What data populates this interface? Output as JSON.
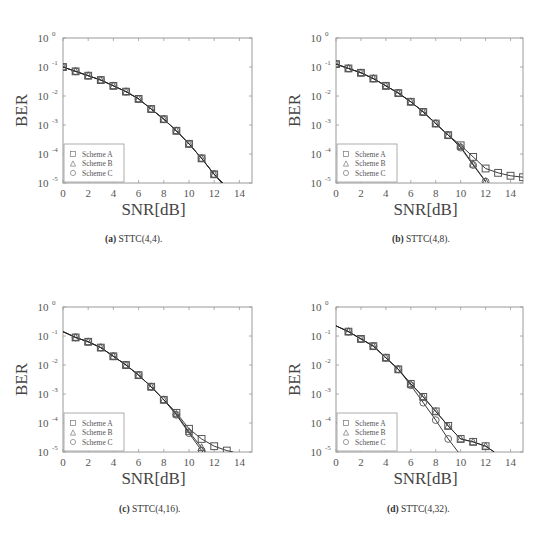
{
  "chart_data": [
    {
      "type": "line",
      "caption_label": "(a)",
      "caption_text": "STTC(4,4).",
      "xlabel": "SNR[dB]",
      "ylabel": "BER",
      "xlim": [
        0,
        15
      ],
      "ylim": [
        1e-05,
        1
      ],
      "yscale": "log",
      "xticks": [
        0,
        2,
        4,
        6,
        8,
        10,
        12,
        14
      ],
      "yticks_exp": [
        0,
        -1,
        -2,
        -3,
        -4,
        -5
      ],
      "legend": [
        "Scheme A",
        "Scheme B",
        "Scheme C"
      ],
      "legend_position": "lower left",
      "grid": false,
      "series": [
        {
          "name": "Scheme A",
          "marker": "square",
          "x": [
            0,
            1,
            2,
            3,
            4,
            5,
            6,
            7,
            8,
            9,
            10,
            11,
            12
          ],
          "log10_y": [
            -1.0,
            -1.15,
            -1.3,
            -1.45,
            -1.65,
            -1.85,
            -2.1,
            -2.45,
            -2.8,
            -3.2,
            -3.65,
            -4.15,
            -4.7
          ],
          "line_end": [
            12.7,
            -5.0
          ]
        },
        {
          "name": "Scheme B",
          "marker": "triangle",
          "x": [
            0,
            1,
            2,
            3,
            4,
            5,
            6,
            7,
            8,
            9,
            10,
            11,
            12
          ],
          "log10_y": [
            -1.0,
            -1.15,
            -1.3,
            -1.45,
            -1.65,
            -1.85,
            -2.1,
            -2.45,
            -2.8,
            -3.2,
            -3.65,
            -4.15,
            -4.7
          ],
          "line_end": [
            12.6,
            -5.0
          ]
        },
        {
          "name": "Scheme C",
          "marker": "circle",
          "x": [
            0,
            1,
            2,
            3,
            4,
            5,
            6,
            7,
            8,
            9,
            10,
            11,
            12
          ],
          "log10_y": [
            -1.0,
            -1.15,
            -1.3,
            -1.45,
            -1.65,
            -1.85,
            -2.1,
            -2.45,
            -2.8,
            -3.2,
            -3.65,
            -4.15,
            -4.7
          ],
          "line_end": [
            12.6,
            -5.0
          ]
        }
      ]
    },
    {
      "type": "line",
      "caption_label": "(b)",
      "caption_text": "STTC(4,8).",
      "xlabel": "SNR[dB]",
      "ylabel": "BER",
      "xlim": [
        0,
        15
      ],
      "ylim": [
        1e-05,
        1
      ],
      "yscale": "log",
      "xticks": [
        0,
        2,
        4,
        6,
        8,
        10,
        12,
        14
      ],
      "yticks_exp": [
        0,
        -1,
        -2,
        -3,
        -4,
        -5
      ],
      "legend": [
        "Scheme A",
        "Scheme B",
        "Scheme C"
      ],
      "legend_position": "lower left",
      "grid": false,
      "series": [
        {
          "name": "Scheme A",
          "marker": "square",
          "x": [
            0,
            1,
            2,
            3,
            4,
            5,
            6,
            7,
            8,
            9,
            10,
            11,
            12,
            13,
            14,
            15
          ],
          "log10_y": [
            -0.9,
            -1.05,
            -1.2,
            -1.4,
            -1.65,
            -1.9,
            -2.2,
            -2.55,
            -2.95,
            -3.35,
            -3.7,
            -4.1,
            -4.5,
            -4.65,
            -4.75,
            -4.8
          ]
        },
        {
          "name": "Scheme B",
          "marker": "triangle",
          "x": [
            0,
            1,
            2,
            3,
            4,
            5,
            6,
            7,
            8,
            9,
            10,
            11,
            12
          ],
          "log10_y": [
            -0.9,
            -1.05,
            -1.2,
            -1.4,
            -1.65,
            -1.9,
            -2.2,
            -2.55,
            -2.95,
            -3.35,
            -3.75,
            -4.35,
            -4.95
          ]
        },
        {
          "name": "Scheme C",
          "marker": "circle",
          "x": [
            0,
            1,
            2,
            3,
            4,
            5,
            6,
            7,
            8,
            9,
            10,
            11,
            12
          ],
          "log10_y": [
            -0.9,
            -1.05,
            -1.2,
            -1.4,
            -1.65,
            -1.9,
            -2.2,
            -2.55,
            -2.95,
            -3.35,
            -3.78,
            -4.38,
            -4.95
          ]
        }
      ]
    },
    {
      "type": "line",
      "caption_label": "(c)",
      "caption_text": "STTC(4,16).",
      "xlabel": "SNR[dB]",
      "ylabel": "BER",
      "xlim": [
        0,
        15
      ],
      "ylim": [
        1e-05,
        1
      ],
      "yscale": "log",
      "xticks": [
        0,
        2,
        4,
        6,
        8,
        10,
        12,
        14
      ],
      "yticks_exp": [
        0,
        -1,
        -2,
        -3,
        -4,
        -5
      ],
      "legend": [
        "Scheme A",
        "Scheme B",
        "Scheme C"
      ],
      "legend_position": "lower left",
      "grid": false,
      "series": [
        {
          "name": "Scheme A",
          "marker": "square",
          "x": [
            1,
            2,
            3,
            4,
            5,
            6,
            7,
            8,
            9,
            10,
            11,
            12,
            13
          ],
          "log10_y": [
            -1.05,
            -1.2,
            -1.4,
            -1.7,
            -2.0,
            -2.35,
            -2.75,
            -3.2,
            -3.65,
            -4.2,
            -4.55,
            -4.8,
            -4.95
          ],
          "line_start": [
            0,
            -0.85
          ],
          "line_end": [
            13.5,
            -5.0
          ]
        },
        {
          "name": "Scheme B",
          "marker": "triangle",
          "x": [
            1,
            2,
            3,
            4,
            5,
            6,
            7,
            8,
            9,
            10,
            11
          ],
          "log10_y": [
            -1.05,
            -1.2,
            -1.4,
            -1.7,
            -2.0,
            -2.35,
            -2.75,
            -3.2,
            -3.7,
            -4.3,
            -4.85
          ],
          "line_start": [
            0,
            -0.85
          ],
          "line_end": [
            11.3,
            -5.0
          ]
        },
        {
          "name": "Scheme C",
          "marker": "circle",
          "x": [
            1,
            2,
            3,
            4,
            5,
            6,
            7,
            8,
            9,
            10,
            11
          ],
          "log10_y": [
            -1.05,
            -1.2,
            -1.4,
            -1.7,
            -2.0,
            -2.35,
            -2.75,
            -3.2,
            -3.72,
            -4.35,
            -4.95
          ],
          "line_start": [
            0,
            -0.85
          ],
          "line_end": [
            11.1,
            -5.0
          ]
        }
      ]
    },
    {
      "type": "line",
      "caption_label": "(d)",
      "caption_text": "STTC(4,32).",
      "xlabel": "SNR[dB]",
      "ylabel": "BER",
      "xlim": [
        0,
        15
      ],
      "ylim": [
        1e-05,
        1
      ],
      "yscale": "log",
      "xticks": [
        0,
        2,
        4,
        6,
        8,
        10,
        12,
        14
      ],
      "yticks_exp": [
        0,
        -1,
        -2,
        -3,
        -4,
        -5
      ],
      "legend": [
        "Scheme A",
        "Scheme B",
        "Scheme C"
      ],
      "legend_position": "lower left",
      "grid": false,
      "series": [
        {
          "name": "Scheme A",
          "marker": "square",
          "x": [
            1,
            2,
            3,
            4,
            5,
            6,
            7,
            8,
            9,
            10,
            11,
            12
          ],
          "log10_y": [
            -0.85,
            -1.1,
            -1.35,
            -1.75,
            -2.15,
            -2.65,
            -3.1,
            -3.6,
            -4.1,
            -4.55,
            -4.65,
            -4.8
          ],
          "line_start": [
            0,
            -0.65
          ],
          "line_end": [
            12.7,
            -5.0
          ]
        },
        {
          "name": "Scheme B",
          "marker": "triangle",
          "x": [
            1,
            2,
            3,
            4,
            5,
            6,
            7,
            8,
            9,
            10,
            11,
            12
          ],
          "log10_y": [
            -0.85,
            -1.1,
            -1.35,
            -1.75,
            -2.15,
            -2.65,
            -3.1,
            -3.6,
            -4.1,
            -4.55,
            -4.65,
            -4.8
          ],
          "line_start": [
            0,
            -0.65
          ],
          "line_end": [
            12.7,
            -5.0
          ]
        },
        {
          "name": "Scheme C",
          "marker": "circle",
          "x": [
            1,
            2,
            3,
            4,
            5,
            6,
            7,
            8,
            9
          ],
          "log10_y": [
            -0.85,
            -1.1,
            -1.35,
            -1.75,
            -2.15,
            -2.7,
            -3.3,
            -3.9,
            -4.55
          ],
          "line_start": [
            0,
            -0.65
          ],
          "line_end": [
            9.8,
            -5.0
          ]
        }
      ]
    }
  ],
  "captions": [
    {
      "label": "(a)",
      "text": "STTC(4,4)."
    },
    {
      "label": "(b)",
      "text": "STTC(4,8)."
    },
    {
      "label": "(c)",
      "text": "STTC(4,16)."
    },
    {
      "label": "(d)",
      "text": "STTC(4,32)."
    }
  ],
  "colors": {
    "frame": "#9a9a9a",
    "line": "#222222",
    "marker": "#555555",
    "text": "#444444"
  }
}
